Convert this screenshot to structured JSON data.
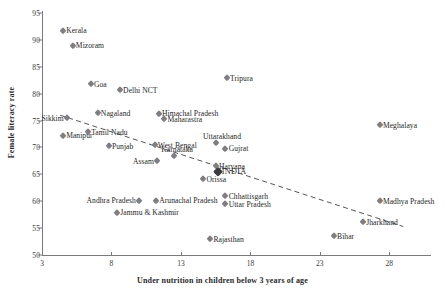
{
  "chart_data": {
    "type": "scatter",
    "title": "",
    "xlabel": "Under nutrition in children below 3 years of age",
    "ylabel": "Female literacy rate",
    "xlim": [
      3,
      31
    ],
    "ylim": [
      50,
      95
    ],
    "xticks": [
      3,
      8,
      13,
      18,
      23,
      28
    ],
    "yticks": [
      50,
      55,
      60,
      65,
      70,
      75,
      80,
      85,
      90,
      95
    ],
    "grid": false,
    "legend": null,
    "trendline": {
      "style": "dashed",
      "x": [
        4.3,
        29.0
      ],
      "y": [
        76.0,
        55.3
      ]
    },
    "points": [
      {
        "label": "Kerala",
        "x": 4.5,
        "y": 91.7,
        "side": "right"
      },
      {
        "label": "Mizoram",
        "x": 5.2,
        "y": 88.9,
        "side": "right"
      },
      {
        "label": "Goa",
        "x": 6.5,
        "y": 81.8,
        "side": "right"
      },
      {
        "label": "Delhi NCT",
        "x": 8.6,
        "y": 80.7,
        "side": "right"
      },
      {
        "label": "Tripura",
        "x": 16.3,
        "y": 82.9,
        "side": "right"
      },
      {
        "label": "Sikkim",
        "x": 4.8,
        "y": 75.4,
        "side": "left"
      },
      {
        "label": "Nagaland",
        "x": 7.0,
        "y": 76.4,
        "side": "right"
      },
      {
        "label": "Himachal Pradesh",
        "x": 11.4,
        "y": 76.3,
        "side": "right"
      },
      {
        "label": "Maharastra",
        "x": 11.8,
        "y": 75.2,
        "side": "right"
      },
      {
        "label": "Meghalaya",
        "x": 27.3,
        "y": 74.1,
        "side": "right"
      },
      {
        "label": "Tamil Nadu",
        "x": 6.3,
        "y": 72.9,
        "side": "right"
      },
      {
        "label": "Manipur",
        "x": 4.5,
        "y": 72.2,
        "side": "right"
      },
      {
        "label": "Punjab",
        "x": 7.8,
        "y": 70.3,
        "side": "right"
      },
      {
        "label": "West Bengal",
        "x": 11.1,
        "y": 70.4,
        "side": "right"
      },
      {
        "label": "Uttarakhand",
        "x": 15.5,
        "y": 70.9,
        "side": "above"
      },
      {
        "label": "Gujrat",
        "x": 16.2,
        "y": 69.8,
        "side": "right"
      },
      {
        "label": "Karnataka",
        "x": 12.5,
        "y": 68.4,
        "side": "above"
      },
      {
        "label": "Assam",
        "x": 11.3,
        "y": 67.4,
        "side": "left"
      },
      {
        "label": "Haryana",
        "x": 15.5,
        "y": 66.5,
        "side": "right"
      },
      {
        "label": "INDIA",
        "x": 15.7,
        "y": 65.5,
        "side": "right"
      },
      {
        "label": "Orissa",
        "x": 14.6,
        "y": 64.1,
        "side": "right"
      },
      {
        "label": "Andhra Pradesh",
        "x": 10.0,
        "y": 60.1,
        "side": "left"
      },
      {
        "label": "Arunachal Pradesh",
        "x": 11.2,
        "y": 60.1,
        "side": "right"
      },
      {
        "label": "Chhattisgarh",
        "x": 16.2,
        "y": 60.9,
        "side": "right"
      },
      {
        "label": "Uttar Pradesh",
        "x": 16.2,
        "y": 59.4,
        "side": "right"
      },
      {
        "label": "Madhya Pradesh",
        "x": 27.3,
        "y": 60.0,
        "side": "right"
      },
      {
        "label": "Jammu & Kashmir",
        "x": 8.4,
        "y": 57.9,
        "side": "right"
      },
      {
        "label": "Jharkhand",
        "x": 26.1,
        "y": 56.1,
        "side": "right"
      },
      {
        "label": "Rajasthan",
        "x": 15.1,
        "y": 52.9,
        "side": "right"
      },
      {
        "label": "Bihar",
        "x": 24.0,
        "y": 53.5,
        "side": "right"
      }
    ]
  }
}
